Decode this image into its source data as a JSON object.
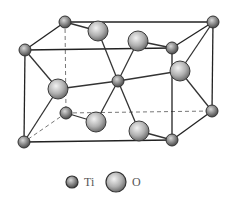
{
  "colors": {
    "bond": "#333333",
    "edge": "#222222",
    "dashed": "#777777",
    "atom_fill_light": "#e6e6e6",
    "atom_fill_dark": "#7a7a7a",
    "atom_stroke": "#3a3a3a"
  },
  "legend": {
    "ti_label": "Ti",
    "o_label": "O"
  },
  "atoms": {
    "ti": [
      {
        "id": "ti-top-back-left",
        "x": 65,
        "y": 22
      },
      {
        "id": "ti-top-front-left",
        "x": 25,
        "y": 50
      },
      {
        "id": "ti-top-back-right",
        "x": 213,
        "y": 22
      },
      {
        "id": "ti-top-front-right",
        "x": 172,
        "y": 48
      },
      {
        "id": "ti-center",
        "x": 118,
        "y": 81
      },
      {
        "id": "ti-bottom-back-left",
        "x": 66,
        "y": 113
      },
      {
        "id": "ti-bottom-front-left",
        "x": 24,
        "y": 142
      },
      {
        "id": "ti-bottom-back-right",
        "x": 212,
        "y": 111
      },
      {
        "id": "ti-bottom-front-right",
        "x": 172,
        "y": 140
      }
    ],
    "o": [
      {
        "id": "o-top-1",
        "x": 98,
        "y": 31
      },
      {
        "id": "o-top-2",
        "x": 138,
        "y": 41
      },
      {
        "id": "o-mid-left",
        "x": 58,
        "y": 89
      },
      {
        "id": "o-mid-right",
        "x": 180,
        "y": 71
      },
      {
        "id": "o-bottom-1",
        "x": 96,
        "y": 122
      },
      {
        "id": "o-bottom-2",
        "x": 139,
        "y": 131
      }
    ]
  }
}
